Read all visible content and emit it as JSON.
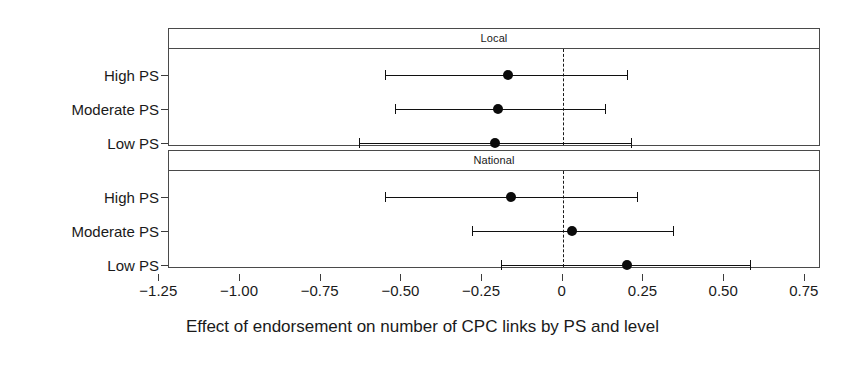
{
  "chart_data": {
    "type": "scatter",
    "plot_style": "forest-plot / coefficient plot with 95% confidence intervals",
    "title": "",
    "xlabel": "Effect of endorsement on number of CPC links by PS and level",
    "ylabel": "",
    "xlim": [
      -1.22,
      0.8
    ],
    "xticks": [
      -1.25,
      -1.0,
      -0.75,
      -0.5,
      -0.25,
      0,
      0.25,
      0.5,
      0.75
    ],
    "xticklabels": [
      "-1.25",
      "-1.00",
      "-0.75",
      "-0.50",
      "-0.25",
      "0",
      "0.25",
      "0.50",
      "0.75"
    ],
    "grid": false,
    "legend": null,
    "reference_line": 0,
    "reference_line_style": "dashed",
    "categories": [
      "High PS",
      "Moderate PS",
      "Low PS"
    ],
    "panels": [
      {
        "strip_label": "Local",
        "points": [
          {
            "category": "High PS",
            "estimate": -0.17,
            "low": -0.55,
            "high": 0.2
          },
          {
            "category": "Moderate PS",
            "estimate": -0.2,
            "low": -0.52,
            "high": 0.13
          },
          {
            "category": "Low PS",
            "estimate": -0.21,
            "low": -0.63,
            "high": 0.21
          }
        ]
      },
      {
        "strip_label": "National",
        "points": [
          {
            "category": "High PS",
            "estimate": -0.16,
            "low": -0.55,
            "high": 0.23
          },
          {
            "category": "Moderate PS",
            "estimate": 0.03,
            "low": -0.28,
            "high": 0.34
          },
          {
            "category": "Low PS",
            "estimate": 0.2,
            "low": -0.19,
            "high": 0.58
          }
        ]
      }
    ]
  },
  "colors": {
    "point": "#0b0b0b",
    "interval": "#101010",
    "axis": "#3c3c3c",
    "panel_border": "#4a4a4a",
    "background": "#ffffff",
    "text": "#1a1a1a"
  }
}
